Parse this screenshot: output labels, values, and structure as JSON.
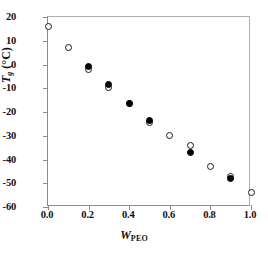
{
  "chart_data": {
    "type": "scatter",
    "title": "",
    "xlabel": "W_PEO",
    "xlabel_var": "W",
    "xlabel_sub": "PEO",
    "ylabel": "Tg (C)",
    "ylabel_var": "T",
    "ylabel_sub": "g",
    "ylabel_unit": "(°C)",
    "xlim": [
      0.0,
      1.0
    ],
    "ylim": [
      -60,
      20
    ],
    "xticks": [
      "0.0",
      "0.2",
      "0.4",
      "0.6",
      "0.8",
      "1.0"
    ],
    "xtick_values": [
      0.0,
      0.2,
      0.4,
      0.6,
      0.8,
      1.0
    ],
    "yticks": [
      "20",
      "10",
      "0",
      "-10",
      "-20",
      "-30",
      "-40",
      "-50",
      "-60"
    ],
    "ytick_values": [
      20,
      10,
      0,
      -10,
      -20,
      -30,
      -40,
      -50,
      -60
    ],
    "grid": false,
    "legend": "none",
    "marker_color": "#000000",
    "axis_color": "#8c8c8c",
    "series": [
      {
        "name": "open-circles",
        "marker": "open-circle",
        "x": [
          0.0,
          0.1,
          0.2,
          0.3,
          0.4,
          0.5,
          0.6,
          0.7,
          0.8,
          0.9,
          1.0
        ],
        "y": [
          16,
          7,
          -2,
          -9.5,
          -16.5,
          -24.5,
          -30,
          -34,
          -43,
          -47,
          -54
        ]
      },
      {
        "name": "filled-circles",
        "marker": "filled-circle",
        "x": [
          0.2,
          0.3,
          0.5,
          0.7,
          0.9
        ],
        "y": [
          -1,
          -8.5,
          -23.5,
          -37,
          -48
        ]
      },
      {
        "name": "filled-circle-solo",
        "marker": "filled-circle",
        "x": [
          0.4
        ],
        "y": [
          -16.5
        ]
      }
    ]
  }
}
